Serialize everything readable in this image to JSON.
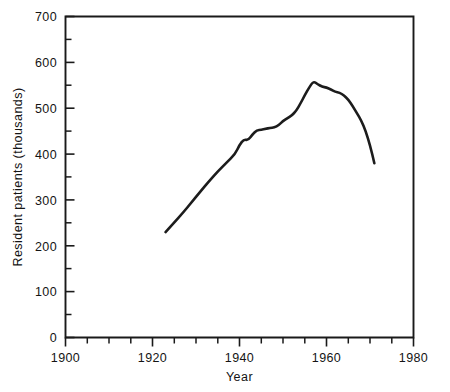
{
  "chart_data": {
    "type": "line",
    "title": "",
    "subtitle": "",
    "xlabel": "Year",
    "ylabel": "Resident patients (thousands)",
    "xlim": [
      1900,
      1980
    ],
    "ylim": [
      0,
      700
    ],
    "grid": false,
    "legend": null,
    "x_ticks_major": [
      1900,
      1920,
      1940,
      1960,
      1980
    ],
    "x_tick_labels": [
      "1900",
      "1920",
      "1940",
      "1960",
      "1980"
    ],
    "x_tick_minor_step": 5,
    "y_ticks_major": [
      0,
      100,
      200,
      300,
      400,
      500,
      600,
      700
    ],
    "y_tick_labels": [
      "0",
      "100",
      "200",
      "300",
      "400",
      "500",
      "600",
      "700"
    ],
    "y_tick_minor_step": 50,
    "series": [
      {
        "name": "Resident patients",
        "x": [
          1923,
          1925,
          1927,
          1929,
          1931,
          1933,
          1935,
          1937,
          1939,
          1940,
          1941,
          1942,
          1943,
          1944,
          1945,
          1946,
          1947,
          1948,
          1949,
          1950,
          1951,
          1952,
          1953,
          1954,
          1955,
          1956,
          1957,
          1958,
          1959,
          1960,
          1961,
          1962,
          1963,
          1964,
          1965,
          1966,
          1967,
          1968,
          1969,
          1970,
          1971
        ],
        "values": [
          230,
          251,
          272,
          295,
          318,
          341,
          362,
          381,
          400,
          420,
          432,
          430,
          443,
          452,
          453,
          455,
          457,
          458,
          463,
          472,
          478,
          484,
          494,
          510,
          528,
          545,
          559,
          552,
          547,
          545,
          541,
          536,
          534,
          528,
          519,
          505,
          489,
          473,
          450,
          420,
          380
        ],
        "color": "#1c1c1c"
      }
    ],
    "data_start_year": 1923,
    "data_end_year": 1971,
    "peak_year": 1955,
    "peak_value": 559,
    "start_value": 230,
    "end_value": 308
  },
  "axis": {
    "y_axis_title": "Resident patients (thousands)",
    "x_axis_title": "Year"
  }
}
